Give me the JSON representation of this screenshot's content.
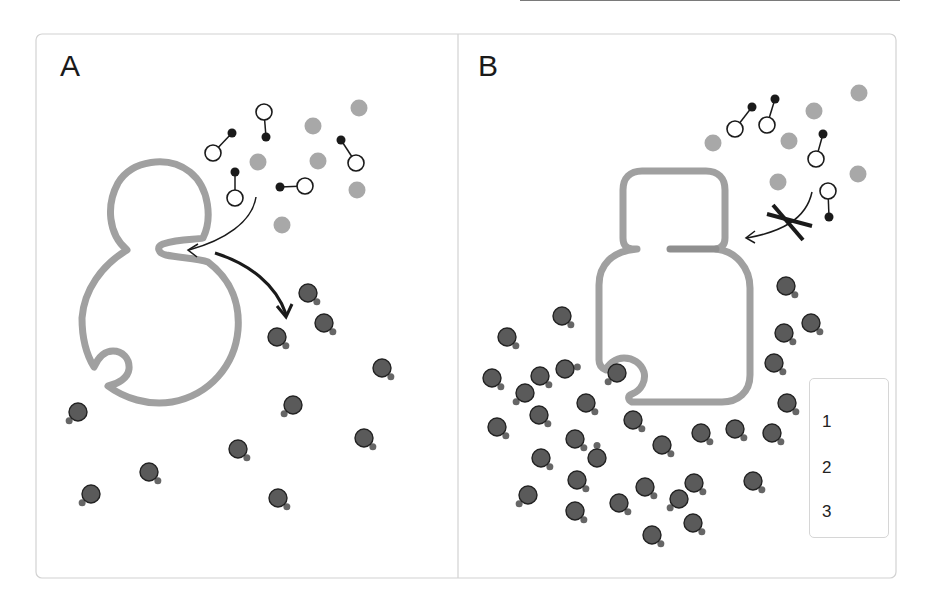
{
  "figure": {
    "panels": [
      {
        "id": "A",
        "label": "A",
        "description": "Budding cell with open neck; type-1 molecules enter, type-3 molecules leave"
      },
      {
        "id": "B",
        "label": "B",
        "description": "Cell with closed neck; type-1 entry blocked, type-3 molecules accumulate"
      }
    ],
    "legend": {
      "items": [
        {
          "number": "1",
          "symbol": "dumbbell-molecule"
        },
        {
          "number": "2",
          "symbol": "grey-dot"
        },
        {
          "number": "3",
          "symbol": "dark-bead-with-tail"
        }
      ]
    },
    "colors": {
      "membrane": "#a0a0a0",
      "grey_dot": "#a8a8a8",
      "dark_bead": "#5a5a5a",
      "bead_outline": "#222222",
      "tail": "#666666",
      "arrow": "#1a1a1a",
      "frame": "#d0d0d0"
    },
    "panelA": {
      "mol1": [
        [
          264,
          112,
          266,
          137
        ],
        [
          213,
          153,
          232,
          133
        ],
        [
          235,
          198,
          235,
          172
        ],
        [
          305,
          186,
          280,
          187
        ],
        [
          356,
          163,
          341,
          140
        ]
      ],
      "mol2": [
        [
          359,
          108
        ],
        [
          313,
          126
        ],
        [
          258,
          162
        ],
        [
          318,
          161
        ],
        [
          357,
          190
        ],
        [
          282,
          225
        ]
      ],
      "mol3": [
        [
          308,
          293,
          1,
          1
        ],
        [
          324,
          323,
          1,
          1
        ],
        [
          277,
          337,
          1,
          1
        ],
        [
          382,
          368,
          1,
          1
        ],
        [
          293,
          405,
          -1,
          1
        ],
        [
          78,
          412,
          -1,
          1
        ],
        [
          364,
          438,
          1,
          1
        ],
        [
          238,
          449,
          1,
          1
        ],
        [
          149,
          472,
          1,
          1
        ],
        [
          91,
          494,
          -1,
          1
        ],
        [
          278,
          498,
          1,
          1
        ]
      ]
    },
    "panelB": {
      "mol1": [
        [
          735,
          129,
          752,
          107
        ],
        [
          767,
          125,
          775,
          99
        ],
        [
          816,
          159,
          823,
          134
        ],
        [
          828,
          191,
          829,
          217
        ]
      ],
      "mol2": [
        [
          859,
          93
        ],
        [
          814,
          111
        ],
        [
          713,
          143
        ],
        [
          789,
          141
        ],
        [
          858,
          174
        ],
        [
          778,
          182
        ]
      ],
      "mol3": [
        [
          562,
          316,
          1,
          1
        ],
        [
          507,
          337,
          1,
          1
        ],
        [
          492,
          378,
          1,
          1
        ],
        [
          540,
          376,
          1,
          1
        ],
        [
          565,
          369,
          1.3,
          -0.2
        ],
        [
          617,
          373,
          -1,
          1
        ],
        [
          525,
          393,
          -1,
          1
        ],
        [
          586,
          403,
          1,
          1
        ],
        [
          539,
          415,
          1,
          1
        ],
        [
          497,
          427,
          1,
          1
        ],
        [
          575,
          439,
          1,
          1
        ],
        [
          597,
          458,
          0,
          -1.4
        ],
        [
          541,
          458,
          1,
          1
        ],
        [
          577,
          480,
          1,
          1
        ],
        [
          528,
          495,
          -1,
          1
        ],
        [
          575,
          511,
          1,
          1
        ],
        [
          619,
          503,
          1,
          1
        ],
        [
          645,
          487,
          1,
          1
        ],
        [
          633,
          420,
          1,
          1
        ],
        [
          662,
          445,
          1,
          1
        ],
        [
          786,
          286,
          1,
          1
        ],
        [
          811,
          323,
          1,
          1
        ],
        [
          784,
          333,
          1,
          1
        ],
        [
          774,
          363,
          1,
          1
        ],
        [
          787,
          403,
          1,
          1
        ],
        [
          772,
          433,
          1,
          1
        ],
        [
          735,
          429,
          1,
          1
        ],
        [
          701,
          433,
          1,
          1
        ],
        [
          753,
          481,
          1,
          1
        ],
        [
          694,
          483,
          1,
          1
        ],
        [
          679,
          499,
          -1,
          1
        ],
        [
          693,
          523,
          1,
          1
        ],
        [
          652,
          535,
          1,
          1
        ]
      ]
    }
  }
}
